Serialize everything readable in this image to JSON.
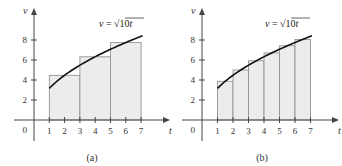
{
  "chart_data": [
    {
      "type": "bar",
      "title": "",
      "caption": "(a)",
      "xlabel": "t",
      "ylabel": "v",
      "curve_label": "v = √10t",
      "curve": "v = sqrt(10 t)",
      "xlim": [
        0,
        7
      ],
      "ylim": [
        0,
        8
      ],
      "xticks": [
        "1",
        "2",
        "3",
        "4",
        "5",
        "6",
        "7"
      ],
      "yticks": [
        "2",
        "4",
        "6",
        "8"
      ],
      "origin_label": "0",
      "grid": false,
      "rectangles": [
        {
          "x_start": 1,
          "x_end": 3,
          "height": 4.47
        },
        {
          "x_start": 3,
          "x_end": 5,
          "height": 6.32
        },
        {
          "x_start": 5,
          "x_end": 7,
          "height": 7.75
        }
      ]
    },
    {
      "type": "bar",
      "title": "",
      "caption": "(b)",
      "xlabel": "t",
      "ylabel": "v",
      "curve_label": "v = √10t",
      "curve": "v = sqrt(10 t)",
      "xlim": [
        0,
        7
      ],
      "ylim": [
        0,
        8
      ],
      "xticks": [
        "1",
        "2",
        "3",
        "4",
        "5",
        "6",
        "7"
      ],
      "yticks": [
        "2",
        "4",
        "6",
        "8"
      ],
      "origin_label": "0",
      "grid": false,
      "rectangles": [
        {
          "x_start": 1,
          "x_end": 2,
          "height": 3.87
        },
        {
          "x_start": 2,
          "x_end": 3,
          "height": 5.0
        },
        {
          "x_start": 3,
          "x_end": 4,
          "height": 5.92
        },
        {
          "x_start": 4,
          "x_end": 5,
          "height": 6.71
        },
        {
          "x_start": 5,
          "x_end": 6,
          "height": 7.42
        },
        {
          "x_start": 6,
          "x_end": 7,
          "height": 8.06
        }
      ]
    }
  ],
  "style": {
    "rect_fill": "#ececec",
    "rect_stroke": "#8a8a8a",
    "curve_color": "#111111",
    "axis_color": "#444444"
  }
}
